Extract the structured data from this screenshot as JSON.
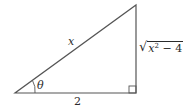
{
  "diagram": {
    "type": "right-triangle",
    "vertices": {
      "angle_vertex": [
        15,
        93
      ],
      "right_angle_vertex": [
        136,
        93
      ],
      "top_vertex": [
        136,
        5
      ]
    },
    "labels": {
      "hypotenuse": "x",
      "base": "2",
      "angle": "θ",
      "opposite_radicand_var": "x",
      "opposite_exponent": "2",
      "opposite_rest": " − 4",
      "radical_sign": "√"
    },
    "stroke_color": "#555555",
    "text_color": "#2a2a2a"
  }
}
